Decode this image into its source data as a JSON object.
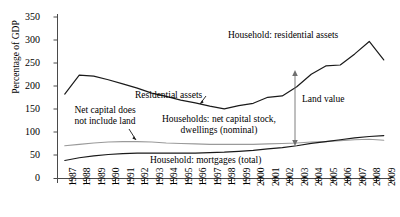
{
  "chart_data": {
    "type": "line",
    "title": "",
    "xlabel": "",
    "ylabel": "Percentage of GDP",
    "ylim": [
      0,
      350
    ],
    "yticks": [
      0,
      50,
      100,
      150,
      200,
      250,
      300,
      350
    ],
    "grid": false,
    "legend_position": "inline-annotations",
    "x": [
      1987,
      1988,
      1989,
      1990,
      1991,
      1992,
      1993,
      1994,
      1995,
      1996,
      1997,
      1998,
      1999,
      2000,
      2001,
      2002,
      2003,
      2004,
      2005,
      2006,
      2007,
      2008,
      2009
    ],
    "categories": [
      "1987",
      "1988",
      "1989",
      "1990",
      "1991",
      "1992",
      "1993",
      "1994",
      "1995",
      "1996",
      "1997",
      "1998",
      "1999",
      "2000",
      "2001",
      "2002",
      "2003",
      "2004",
      "2005",
      "2006",
      "2007",
      "2008",
      "2009"
    ],
    "series": [
      {
        "name": "Household: residential assets",
        "color": "#1a1a1a",
        "width": 1.2,
        "values": [
          183,
          224,
          222,
          214,
          205,
          196,
          185,
          178,
          170,
          164,
          157,
          151,
          158,
          163,
          176,
          179,
          199,
          226,
          244,
          246,
          270,
          297,
          257
        ]
      },
      {
        "name": "Households: net capital stock, dwellings (nominal)",
        "color": "#9a9a9a",
        "width": 1.1,
        "values": [
          71,
          74,
          77,
          79,
          80,
          80,
          79,
          77,
          76,
          75,
          74,
          74,
          74,
          74,
          75,
          76,
          77,
          79,
          80,
          82,
          84,
          85,
          83
        ]
      },
      {
        "name": "Household: mortgages (total)",
        "color": "#1a1a1a",
        "width": 1.2,
        "values": [
          39,
          45,
          49,
          52,
          54,
          55,
          55,
          55,
          55,
          55,
          56,
          57,
          59,
          61,
          64,
          67,
          71,
          76,
          80,
          84,
          88,
          91,
          93
        ]
      }
    ],
    "annotations": [
      {
        "id": "residential-assets",
        "text": "Residential assets",
        "has_leader": true
      },
      {
        "id": "household-res-assets",
        "text": "Household: residential assets",
        "has_leader": false
      },
      {
        "id": "net-capital-note",
        "text_line1": "Net capital does",
        "text_line2": "not include land",
        "has_leader": true
      },
      {
        "id": "net-capital-stock",
        "text_line1": "Households: net capital stock,",
        "text_line2": "dwellings (nominal)",
        "has_leader": false
      },
      {
        "id": "mortgages",
        "text": "Household: mortgages (total)",
        "has_leader": false
      },
      {
        "id": "land-value",
        "text": "Land value",
        "has_leader": true
      }
    ]
  }
}
